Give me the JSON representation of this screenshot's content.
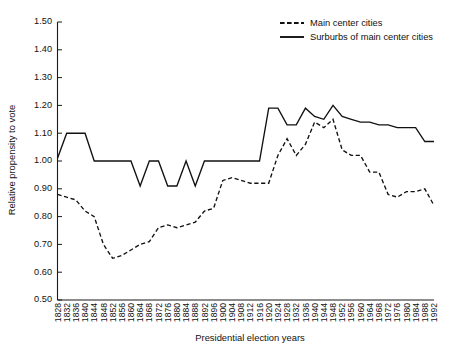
{
  "chart_data": {
    "type": "line",
    "title": "",
    "xlabel": "Presidential election years",
    "ylabel": "Relative propensity to vote",
    "ylim": [
      0.5,
      1.5
    ],
    "ytick_labels": [
      "0.50",
      "0.60",
      "0.70",
      "0.80",
      "0.90",
      "1.00",
      "1.10",
      "1.20",
      "1.30",
      "1.40",
      "1.50"
    ],
    "ytick_values": [
      0.5,
      0.6,
      0.7,
      0.8,
      0.9,
      1.0,
      1.1,
      1.2,
      1.3,
      1.4,
      1.5
    ],
    "grid": false,
    "legend_position": "top-right",
    "categories": [
      "1828",
      "1832",
      "1836",
      "1840",
      "1844",
      "1848",
      "1852",
      "1856",
      "1860",
      "1864",
      "1868",
      "1872",
      "1876",
      "1880",
      "1884",
      "1888",
      "1892",
      "1896",
      "1900",
      "1904",
      "1908",
      "1912",
      "1916",
      "1920",
      "1924",
      "1928",
      "1932",
      "1936",
      "1940",
      "1944",
      "1948",
      "1952",
      "1956",
      "1960",
      "1964",
      "1968",
      "1972",
      "1976",
      "1980",
      "1984",
      "1988",
      "1992"
    ],
    "series": [
      {
        "name": "Main center cities",
        "style": "dashed",
        "color": "#111111",
        "values": [
          0.88,
          0.87,
          0.86,
          0.82,
          0.8,
          0.7,
          0.65,
          0.66,
          0.68,
          0.7,
          0.71,
          0.76,
          0.77,
          0.76,
          0.77,
          0.78,
          0.82,
          0.83,
          0.93,
          0.94,
          0.93,
          0.92,
          0.92,
          0.92,
          1.02,
          1.08,
          1.02,
          1.06,
          1.14,
          1.12,
          1.15,
          1.04,
          1.02,
          1.02,
          0.96,
          0.96,
          0.88,
          0.87,
          0.89,
          0.89,
          0.9,
          0.84
        ]
      },
      {
        "name": "Surburbs of main center cities",
        "style": "solid",
        "color": "#111111",
        "values": [
          1.01,
          1.1,
          1.1,
          1.1,
          1.0,
          1.0,
          1.0,
          1.0,
          1.0,
          0.91,
          1.0,
          1.0,
          0.91,
          0.91,
          1.0,
          0.91,
          1.0,
          1.0,
          1.0,
          1.0,
          1.0,
          1.0,
          1.0,
          1.19,
          1.19,
          1.13,
          1.13,
          1.19,
          1.16,
          1.15,
          1.2,
          1.16,
          1.15,
          1.14,
          1.14,
          1.13,
          1.13,
          1.12,
          1.12,
          1.12,
          1.07,
          1.07
        ]
      }
    ]
  },
  "legend": {
    "items": [
      {
        "label": "Main center cities",
        "style": "dashed"
      },
      {
        "label": "Surburbs of main center cities",
        "style": "solid"
      }
    ]
  },
  "axes": {
    "y_title": "Relative propensity to vote",
    "x_title": "Presidential election years"
  }
}
